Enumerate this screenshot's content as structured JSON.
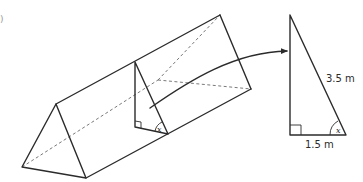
{
  "figure": {
    "question_mark": ")",
    "prism": {
      "description": "triangular prism with shaded right-triangle cross-section",
      "cross_section_angle_label": "x"
    },
    "arrow": {
      "description": "curved arrow from cross-section to enlarged triangle"
    },
    "right_triangle": {
      "hypotenuse_label": "3.5 m",
      "base_label": "1.5 m",
      "angle_label": "x",
      "right_angle_marker": "right-angle"
    }
  },
  "colors": {
    "line": "#2b2b2b",
    "hidden_line": "#6a6a6a",
    "background": "#ffffff"
  }
}
